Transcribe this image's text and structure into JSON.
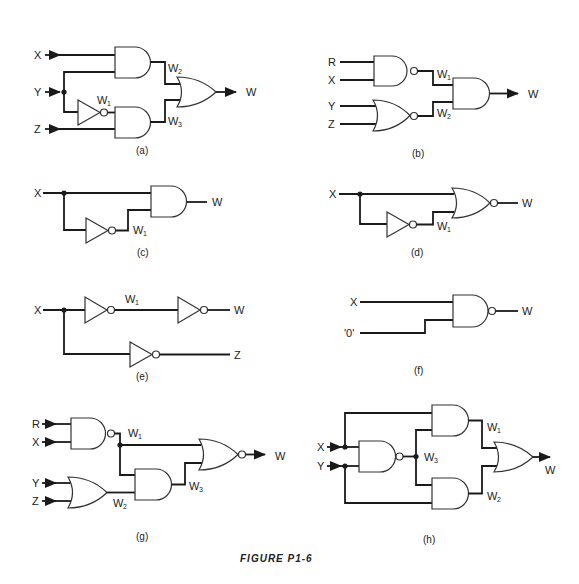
{
  "figure": {
    "caption": "FIGURE P1-6"
  },
  "circuits": {
    "a": {
      "caption": "(a)",
      "inputs": [
        "X",
        "Y",
        "Z"
      ],
      "output": "W",
      "wires": {
        "w1": "W",
        "w1_sub": "1",
        "w2": "W",
        "w2_sub": "2",
        "w3": "W",
        "w3_sub": "3"
      },
      "gates": [
        "AND",
        "NOT",
        "AND",
        "OR"
      ]
    },
    "b": {
      "caption": "(b)",
      "inputs": [
        "R",
        "X",
        "Y",
        "Z"
      ],
      "output": "W",
      "wires": {
        "w1": "W",
        "w1_sub": "1",
        "w2": "W",
        "w2_sub": "2"
      },
      "gates": [
        "NAND",
        "NOR",
        "AND"
      ]
    },
    "c": {
      "caption": "(c)",
      "inputs": [
        "X"
      ],
      "output": "W",
      "wires": {
        "w1": "W",
        "w1_sub": "1"
      },
      "gates": [
        "NOT",
        "AND"
      ]
    },
    "d": {
      "caption": "(d)",
      "inputs": [
        "X"
      ],
      "output": "W",
      "wires": {
        "w1": "W",
        "w1_sub": "1"
      },
      "gates": [
        "NOT",
        "NOR"
      ]
    },
    "e": {
      "caption": "(e)",
      "inputs": [
        "X"
      ],
      "outputs": [
        "W",
        "Z"
      ],
      "wires": {
        "w1": "W",
        "w1_sub": "1"
      },
      "gates": [
        "NOT",
        "NOT",
        "NOT"
      ]
    },
    "f": {
      "caption": "(f)",
      "inputs": [
        "X",
        "'0'"
      ],
      "output": "W",
      "gates": [
        "NAND"
      ]
    },
    "g": {
      "caption": "(g)",
      "inputs": [
        "R",
        "X",
        "Y",
        "Z"
      ],
      "output": "W",
      "wires": {
        "w1": "W",
        "w1_sub": "1",
        "w2": "W",
        "w2_sub": "2",
        "w3": "W",
        "w3_sub": "3"
      },
      "gates": [
        "NAND",
        "OR",
        "AND",
        "NOR"
      ]
    },
    "h": {
      "caption": "(h)",
      "inputs": [
        "X",
        "Y"
      ],
      "output": "W",
      "wires": {
        "w1": "W",
        "w1_sub": "1",
        "w2": "W",
        "w2_sub": "2",
        "w3": "W",
        "w3_sub": "3"
      },
      "gates": [
        "NAND",
        "AND",
        "AND",
        "OR"
      ]
    }
  }
}
